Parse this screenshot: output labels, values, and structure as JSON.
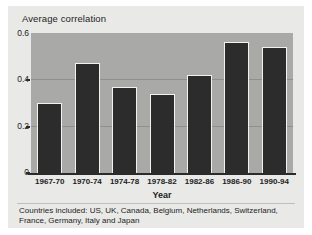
{
  "figure": {
    "background_color": "#e9e9e7",
    "plot_background_color": "#a9a9a7",
    "bar_color": "#2c2c2c",
    "bar_edge_color": "#f2f2f0",
    "gridline_color": "#8f8f8d",
    "axis_color": "#2b2b2b"
  },
  "footnote": {
    "line1": "Countries included: US, UK, Canada, Belgium, Netherlands, Switzerland,",
    "line2": "France, Germany, Italy and Japan"
  },
  "chart_data": {
    "type": "bar",
    "title": "Average correlation",
    "xlabel": "Year",
    "ylabel": "Average correlation",
    "categories": [
      "1967-70",
      "1970-74",
      "1974-78",
      "1978-82",
      "1982-86",
      "1986-90",
      "1990-94"
    ],
    "values": [
      0.3,
      0.47,
      0.37,
      0.34,
      0.42,
      0.56,
      0.54
    ],
    "ylim": [
      0,
      0.6
    ],
    "yticks": [
      0,
      0.2,
      0.4,
      0.6
    ],
    "ytick_labels": [
      "0",
      "0.2",
      "0.4",
      "0.6"
    ],
    "grid": true,
    "gridlines_at": [
      0.2,
      0.4
    ],
    "legend": null,
    "annotations": [
      "Countries included: US, UK, Canada, Belgium, Netherlands, Switzerland, France, Germany, Italy and Japan"
    ]
  }
}
